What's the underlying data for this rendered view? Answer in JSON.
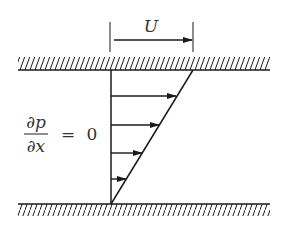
{
  "diagram": {
    "velocity_label": "U",
    "equation": {
      "numerator": "∂p",
      "denominator": "∂x",
      "equals": "=",
      "value": "0"
    },
    "walls": {
      "top": "moving plate",
      "bottom": "stationary plate"
    },
    "profile": {
      "type": "linear",
      "arrow_count": 4
    },
    "colors": {
      "ink": "#1a1a1a",
      "text": "#333333",
      "background": "#ffffff"
    }
  }
}
